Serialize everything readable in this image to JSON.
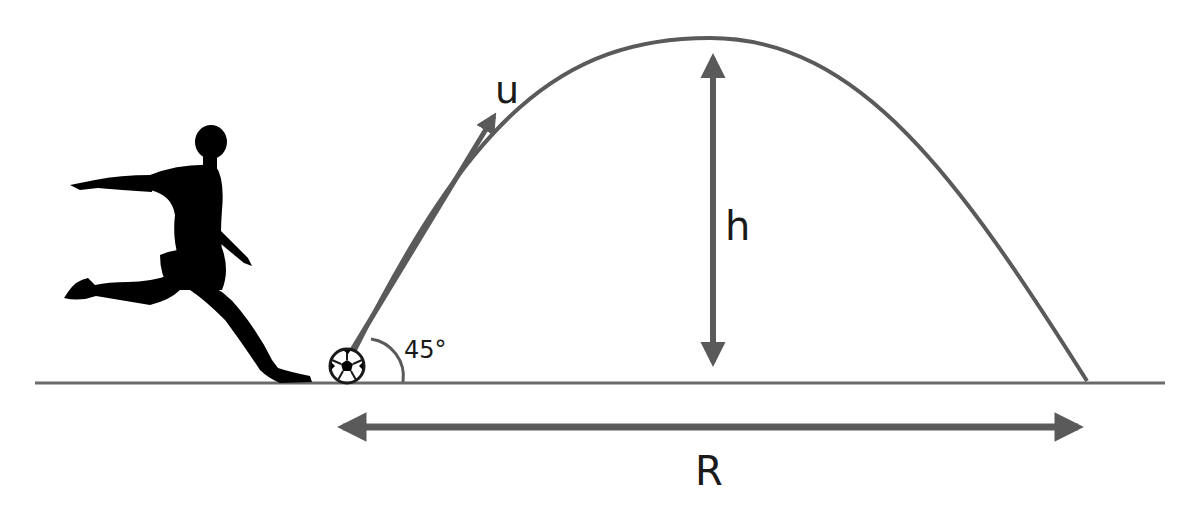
{
  "diagram": {
    "labels": {
      "velocity": "u",
      "max_height": "h",
      "range": "R",
      "launch_angle": "45°"
    },
    "elements": [
      {
        "id": "player",
        "description": "silhouette of soccer player kicking"
      },
      {
        "id": "ball",
        "description": "soccer ball at launch point"
      },
      {
        "id": "trajectory",
        "description": "parabolic path of ball"
      },
      {
        "id": "velocity-arrow",
        "label": "u"
      },
      {
        "id": "height-arrow",
        "label": "h"
      },
      {
        "id": "range-arrow",
        "label": "R"
      },
      {
        "id": "angle-arc",
        "label": "45°"
      },
      {
        "id": "ground-line"
      }
    ],
    "colors": {
      "line": "#5a5a5a",
      "silhouette": "#000000",
      "text": "#1a1a1a",
      "background": "#ffffff"
    }
  }
}
